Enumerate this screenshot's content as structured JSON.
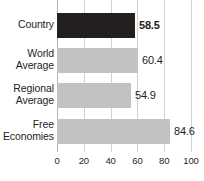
{
  "chart_data": {
    "type": "bar",
    "orientation": "horizontal",
    "title": "",
    "subtitle": "",
    "xlabel": "",
    "ylabel": "",
    "xlim": [
      0,
      100
    ],
    "grid": true,
    "legend": "none",
    "categories": [
      "Country",
      "World Average",
      "Regional Average",
      "Free Economies"
    ],
    "values": [
      58.5,
      60.4,
      54.9,
      84.6
    ],
    "value_labels": [
      "58.5",
      "60.4",
      "54.9",
      "84.6"
    ],
    "category_lines": [
      [
        "Country"
      ],
      [
        "World",
        "Average"
      ],
      [
        "Regional",
        "Average"
      ],
      [
        "Free",
        "Economies"
      ]
    ],
    "xticks": [
      0,
      20,
      40,
      60,
      80,
      100
    ],
    "xtick_labels": [
      "0",
      "20",
      "40",
      "60",
      "80",
      "100"
    ],
    "highlight_index": 0,
    "colors": {
      "bar": "#c2c2c2",
      "bar_highlight": "#231f20",
      "gridline": "#d2d2d2",
      "axis": "#b4b4b4",
      "text": "#231f20",
      "background": "#ffffff"
    }
  }
}
